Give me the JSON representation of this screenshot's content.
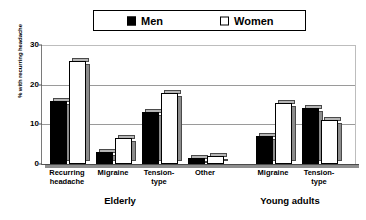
{
  "chart_data": {
    "type": "bar",
    "title": "",
    "xlabel": "",
    "ylabel": "% with recurring headache",
    "ylim": [
      0,
      30
    ],
    "yticks": [
      0,
      10,
      20,
      30
    ],
    "grid": true,
    "legend_position": "top",
    "categories": [
      "Recurring\nheadache",
      "Migraine",
      "Tension-\ntype",
      "Other",
      "Migraine",
      "Tension-\ntype"
    ],
    "groups": [
      {
        "label": "Elderly",
        "categories": [
          "Recurring headache",
          "Migraine",
          "Tension-type",
          "Other"
        ]
      },
      {
        "label": "Young adults",
        "categories": [
          "Migraine",
          "Tension-type"
        ]
      }
    ],
    "series": [
      {
        "name": "Men",
        "color": "#000000",
        "values": [
          16,
          3,
          13,
          1.5,
          7,
          14
        ]
      },
      {
        "name": "Women",
        "color": "#ffffff",
        "values": [
          26,
          6.5,
          18,
          2,
          15.5,
          11
        ]
      }
    ]
  },
  "legend": {
    "entries": [
      {
        "label": "Men",
        "swatch": "filled-square-icon"
      },
      {
        "label": "Women",
        "swatch": "outlined-square-icon"
      }
    ]
  },
  "axis": {
    "y_title": "% with recurring headache",
    "y_tick_labels": [
      "30",
      "20",
      "10",
      "0"
    ]
  },
  "categories_display": [
    {
      "line1": "Recurring",
      "line2": "headache"
    },
    {
      "line1": "Migraine",
      "line2": ""
    },
    {
      "line1": "Tension-",
      "line2": "type"
    },
    {
      "line1": "Other",
      "line2": ""
    },
    {
      "line1": "Migraine",
      "line2": ""
    },
    {
      "line1": "Tension-",
      "line2": "type"
    }
  ],
  "group_labels": [
    "Elderly",
    "Young adults"
  ]
}
